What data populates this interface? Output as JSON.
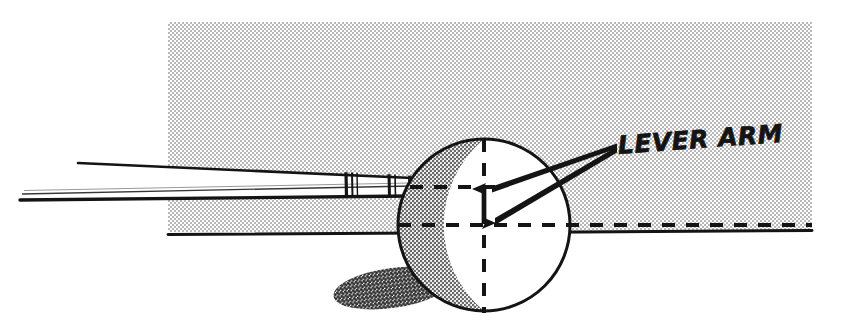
{
  "figure": {
    "kind": "technical-line-illustration",
    "title_text": "LEVER ARM",
    "canvas": {
      "width": 846,
      "height": 329,
      "background_color": "#ffffff"
    }
  },
  "annotations": {
    "lever_arm_label": "LEVER ARM"
  },
  "colors": {
    "ink": "#141414",
    "halftone_background": "#e6e6e6",
    "halftone_dot": "#8c8c8c",
    "ball_shade": "#d2d2d2",
    "ball_shade_dot": "#6e6e6e",
    "cast_shadow": "#9a9a9a",
    "cast_shadow_dot": "#3f3f3f",
    "paper": "#ffffff"
  },
  "geometry": {
    "background_panel": {
      "x": 168,
      "y": 22,
      "width": 644,
      "height": 210
    },
    "ball": {
      "center_x": 484,
      "center_y": 225,
      "radius": 86
    },
    "ground_line": {
      "x1": 168,
      "y1": 234,
      "x2": 812,
      "y2": 230
    },
    "cue": {
      "tip_x": 412,
      "butt_x": 20,
      "band_positions": [
        348,
        392
      ]
    },
    "center_line_vertical": {
      "x": 484,
      "y_top": 139,
      "y_bottom": 312
    },
    "center_line_horizontal": {
      "y": 225,
      "x_left": 398,
      "x_right": 812
    },
    "contact_line_horizontal": {
      "y": 187,
      "x_left": 410,
      "x_right": 500
    },
    "lever_arm_arrow": {
      "x": 484,
      "y_top": 187,
      "y_bottom": 225
    },
    "leader_lines": [
      {
        "x1": 615,
        "y1": 145,
        "x2": 492,
        "y2": 190
      },
      {
        "x1": 615,
        "y1": 148,
        "x2": 494,
        "y2": 222
      }
    ],
    "cast_shadow_ellipse": {
      "center_x": 392,
      "center_y": 288,
      "rx": 58,
      "ry": 19,
      "rotation": -8
    }
  }
}
